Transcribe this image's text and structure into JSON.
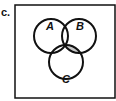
{
  "problem_label": "c.",
  "diagram": {
    "type": "venn",
    "sets": [
      "A",
      "B",
      "C"
    ],
    "shaded_region": "B ∩ C ∩ A'",
    "shade_color": "#c8c8c8",
    "line_color": "#111111"
  }
}
